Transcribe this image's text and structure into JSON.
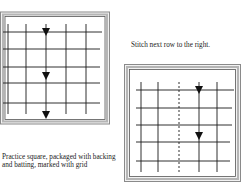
{
  "figures": [
    {
      "id": "practice-square",
      "caption": "Practice square, packaged with backing and batting, marked with grid",
      "grid": {
        "vertical_lines": 5,
        "horizontal_lines": 5,
        "dashed_column": null
      },
      "arrows": {
        "column": 3,
        "count": 3,
        "direction": "down"
      }
    },
    {
      "id": "next-row-square",
      "caption": "Stitch next row to the right.",
      "grid": {
        "vertical_lines": 5,
        "horizontal_lines": 5,
        "dashed_column": 3
      },
      "arrows": {
        "column": 4,
        "count": 2,
        "direction": "down"
      }
    }
  ],
  "colors": {
    "line": "#1a1a1a",
    "frame": "#9a9a9a",
    "frame_inner": "#555555",
    "background": "#ffffff"
  }
}
